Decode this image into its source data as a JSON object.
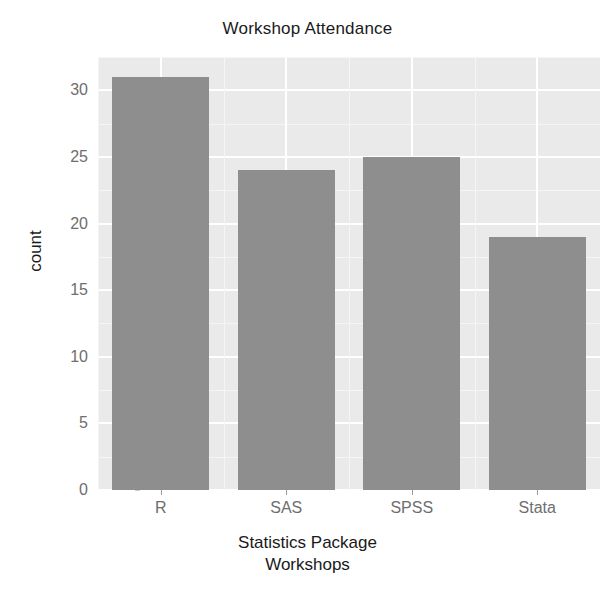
{
  "chart_data": {
    "type": "bar",
    "title": "Workshop Attendance",
    "xlabel": "Statistics Package Workshops",
    "xlabel_line1": "Statistics Package",
    "xlabel_line2": "Workshops",
    "ylabel": "count",
    "categories": [
      "R",
      "SAS",
      "SPSS",
      "Stata"
    ],
    "values": [
      31,
      24,
      25,
      19
    ],
    "ylim": [
      0,
      32.5
    ],
    "y_ticks": [
      0,
      5,
      10,
      15,
      20,
      25,
      30
    ],
    "y_tick_labels": [
      "0",
      "5",
      "10",
      "15",
      "20",
      "25",
      "30"
    ],
    "y_minor_ticks": [
      2.5,
      7.5,
      12.5,
      17.5,
      22.5,
      27.5,
      32.5
    ],
    "grid": true,
    "legend": "none",
    "bar_color": "#8e8e8e",
    "panel_background": "#eaeaea",
    "gridline_color": "#ffffff",
    "title_color": "#1a1a1a",
    "axis_text_color": "#6e6e6e"
  }
}
